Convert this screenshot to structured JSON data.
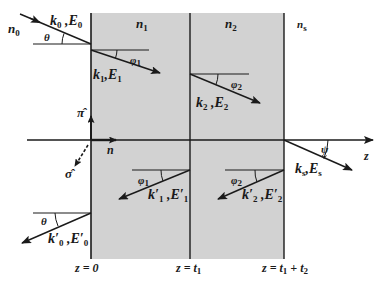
{
  "diagram": {
    "colors": {
      "layer_fill": "#d2d2d2",
      "line": "#1a1a1a",
      "background": "#ffffff"
    },
    "media": {
      "incident": {
        "symbol": "n",
        "sub": "0"
      },
      "layer1": {
        "symbol": "n",
        "sub": "1"
      },
      "layer2": {
        "symbol": "n",
        "sub": "2"
      },
      "substrate": {
        "symbol": "n",
        "sub": "s"
      }
    },
    "waves": {
      "incident": {
        "k": "k",
        "ksub": "0",
        "e": "E",
        "esub": "0",
        "angle": "θ"
      },
      "layer1_forward": {
        "k": "k",
        "ksub": "1",
        "e": "E",
        "esub": "1",
        "angle": "φ",
        "anglesub": "1"
      },
      "layer2_forward": {
        "k": "k",
        "ksub": "2",
        "e": "E",
        "esub": "2",
        "angle": "φ",
        "anglesub": "2"
      },
      "transmitted": {
        "k": "k",
        "ksub": "s",
        "e": "E",
        "esub": "s",
        "angle": "ψ"
      },
      "layer1_backward": {
        "k": "k′",
        "ksub": "1",
        "e": "E′",
        "esub": "1",
        "angle": "φ",
        "anglesub": "1"
      },
      "layer2_backward": {
        "k": "k′",
        "ksub": "2",
        "e": "E′",
        "esub": "2",
        "angle": "φ",
        "anglesub": "2"
      },
      "reflected": {
        "k": "k′",
        "ksub": "0",
        "e": "E′",
        "esub": "0",
        "angle": "θ"
      }
    },
    "vectors": {
      "pi_hat": "π̂",
      "sigma_hat": "σ̂",
      "normal": "n"
    },
    "axis": {
      "label": "z"
    },
    "interfaces": [
      {
        "label": "z = 0"
      },
      {
        "label": "z = t",
        "sub": "1"
      },
      {
        "label": "z = t",
        "sub": "1",
        "extra": " + t",
        "sub2": "2"
      }
    ]
  }
}
